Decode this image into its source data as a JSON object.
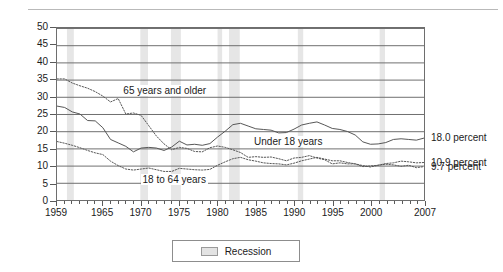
{
  "chart_data": {
    "type": "line",
    "title": "",
    "xlabel": "",
    "ylabel": "Percent",
    "ylim": [
      0,
      50
    ],
    "ytick_step": 5,
    "ytick_labels": [
      "50",
      "45",
      "40",
      "35",
      "30",
      "25",
      "20",
      "15",
      "10",
      "5",
      "0"
    ],
    "xlim": [
      1959,
      2007
    ],
    "xtick_labels": [
      "1959",
      "1965",
      "1970",
      "1975",
      "1980",
      "1985",
      "1990",
      "1995",
      "2000",
      "2007"
    ],
    "xtick_values": [
      1959,
      1965,
      1970,
      1975,
      1980,
      1985,
      1990,
      1995,
      2000,
      2007
    ],
    "grid": "horizontal",
    "legend_position": "bottom-center",
    "legend_entries": [
      "Recession"
    ],
    "series": [
      {
        "name": "65 years and older",
        "style": "dotted",
        "label_x": 1967.5,
        "label_y": 31.5,
        "end_label": "9.7 percent",
        "x": [
          1959,
          1960,
          1961,
          1962,
          1963,
          1964,
          1965,
          1966,
          1967,
          1968,
          1969,
          1970,
          1971,
          1972,
          1973,
          1974,
          1975,
          1976,
          1977,
          1978,
          1979,
          1980,
          1981,
          1982,
          1983,
          1984,
          1985,
          1986,
          1987,
          1988,
          1989,
          1990,
          1991,
          1992,
          1993,
          1994,
          1995,
          1996,
          1997,
          1998,
          1999,
          2000,
          2001,
          2002,
          2003,
          2004,
          2005,
          2006,
          2007
        ],
        "values": [
          35.2,
          35.2,
          34.0,
          33.2,
          32.5,
          31.5,
          30.2,
          28.5,
          29.5,
          25.0,
          25.3,
          24.6,
          21.6,
          18.6,
          16.3,
          14.6,
          15.3,
          15.0,
          14.1,
          14.0,
          15.2,
          15.7,
          15.3,
          14.6,
          13.8,
          12.4,
          12.6,
          12.4,
          12.5,
          12.0,
          11.4,
          12.2,
          12.4,
          12.9,
          12.2,
          11.7,
          10.5,
          10.8,
          10.5,
          10.5,
          9.7,
          9.9,
          10.1,
          10.4,
          10.2,
          9.8,
          10.1,
          9.4,
          9.7
        ]
      },
      {
        "name": "Under 18 years",
        "style": "solid",
        "label_x": 1984.5,
        "label_y": 17.0,
        "end_label": "18.0 percent",
        "x": [
          1959,
          1960,
          1961,
          1962,
          1963,
          1964,
          1965,
          1966,
          1967,
          1968,
          1969,
          1970,
          1971,
          1972,
          1973,
          1974,
          1975,
          1976,
          1977,
          1978,
          1979,
          1980,
          1981,
          1982,
          1983,
          1984,
          1985,
          1986,
          1987,
          1988,
          1989,
          1990,
          1991,
          1992,
          1993,
          1994,
          1995,
          1996,
          1997,
          1998,
          1999,
          2000,
          2001,
          2002,
          2003,
          2004,
          2005,
          2006,
          2007
        ],
        "values": [
          27.3,
          26.9,
          25.6,
          25.0,
          23.1,
          23.0,
          21.0,
          17.6,
          16.6,
          15.6,
          14.0,
          15.1,
          15.3,
          15.1,
          14.4,
          15.4,
          17.1,
          16.0,
          16.2,
          15.9,
          16.4,
          18.3,
          20.0,
          21.9,
          22.3,
          21.5,
          20.7,
          20.5,
          20.3,
          19.5,
          19.6,
          20.6,
          21.8,
          22.3,
          22.7,
          21.8,
          20.8,
          20.5,
          19.9,
          18.9,
          16.9,
          16.2,
          16.3,
          16.7,
          17.6,
          17.8,
          17.6,
          17.4,
          18.0
        ]
      },
      {
        "name": "18 to 64 years",
        "style": "dotted",
        "label_x": 1970.0,
        "label_y": 5.9,
        "end_label": "10.9 percent",
        "x": [
          1959,
          1960,
          1961,
          1962,
          1963,
          1964,
          1965,
          1966,
          1967,
          1968,
          1969,
          1970,
          1971,
          1972,
          1973,
          1974,
          1975,
          1976,
          1977,
          1978,
          1979,
          1980,
          1981,
          1982,
          1983,
          1984,
          1985,
          1986,
          1987,
          1988,
          1989,
          1990,
          1991,
          1992,
          1993,
          1994,
          1995,
          1996,
          1997,
          1998,
          1999,
          2000,
          2001,
          2002,
          2003,
          2004,
          2005,
          2006,
          2007
        ],
        "values": [
          17.0,
          16.5,
          15.9,
          15.2,
          14.4,
          13.7,
          13.2,
          11.3,
          10.0,
          9.0,
          8.7,
          9.0,
          9.3,
          8.8,
          8.3,
          8.3,
          9.2,
          9.0,
          8.8,
          8.7,
          8.9,
          10.1,
          11.1,
          12.0,
          12.4,
          11.7,
          11.3,
          10.8,
          10.6,
          10.5,
          10.2,
          10.7,
          11.4,
          11.9,
          12.4,
          11.9,
          11.4,
          11.4,
          10.9,
          10.5,
          10.0,
          9.6,
          10.1,
          10.6,
          10.8,
          11.3,
          11.1,
          10.8,
          10.9
        ]
      }
    ],
    "recession_bands": [
      {
        "start": 1960.3,
        "end": 1961.2
      },
      {
        "start": 1969.9,
        "end": 1970.9
      },
      {
        "start": 1973.9,
        "end": 1975.2
      },
      {
        "start": 1980.0,
        "end": 1980.6
      },
      {
        "start": 1981.5,
        "end": 1982.9
      },
      {
        "start": 1990.5,
        "end": 1991.2
      },
      {
        "start": 2001.2,
        "end": 2001.9
      }
    ],
    "end_labels": [
      {
        "text": "18.0 percent",
        "value": 18.0
      },
      {
        "text": "10.9 percent",
        "value": 10.9
      },
      {
        "text": "9.7 percent",
        "value": 9.7
      }
    ],
    "colors": {
      "line": "#555555",
      "recession_band": "#e6e6e6",
      "grid": "#6e6e6e",
      "frame": "#6e6e6e",
      "text": "#1b1b1b"
    }
  }
}
